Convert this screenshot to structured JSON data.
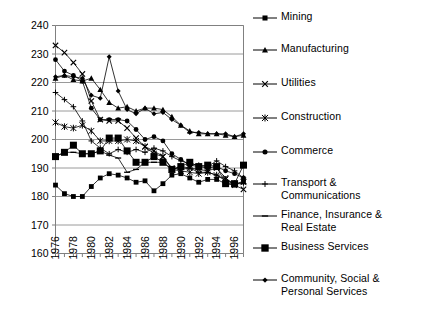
{
  "chart_data": {
    "type": "line",
    "title": "",
    "xlabel": "",
    "ylabel": "",
    "xlim": [
      1976,
      1997
    ],
    "ylim": [
      160,
      240
    ],
    "ytick_step": 10,
    "yticks": [
      160,
      170,
      180,
      190,
      200,
      210,
      220,
      230,
      240
    ],
    "xticks": [
      1976,
      1978,
      1980,
      1982,
      1984,
      1986,
      1988,
      1990,
      1992,
      1994,
      1996
    ],
    "xtick_labels": [
      "1976",
      "1978",
      "1980",
      "1982",
      "1984",
      "1986",
      "1988",
      "1990",
      "1992",
      "1994",
      "1996"
    ],
    "ytick_labels": [
      "160",
      "170",
      "180",
      "190",
      "200",
      "210",
      "220",
      "230",
      "240"
    ],
    "grid": "horizontal",
    "legend_position": "right",
    "x": [
      1976,
      1977,
      1978,
      1979,
      1980,
      1981,
      1982,
      1983,
      1984,
      1985,
      1986,
      1987,
      1988,
      1989,
      1990,
      1991,
      1992,
      1993,
      1994,
      1995,
      1996,
      1997
    ],
    "series": [
      {
        "name": "Mining",
        "marker": "square",
        "values": [
          184.0,
          181.0,
          180.0,
          180.0,
          183.5,
          186.5,
          188.0,
          187.5,
          186.5,
          185.0,
          185.5,
          182.0,
          184.5,
          187.5,
          188.0,
          186.5,
          185.0,
          186.0,
          186.0,
          184.5,
          184.0,
          185.5
        ]
      },
      {
        "name": "Manufacturing",
        "marker": "triangle",
        "values": [
          221.5,
          222.5,
          221.0,
          220.5,
          221.5,
          217.5,
          213.0,
          211.0,
          211.5,
          210.0,
          211.0,
          211.0,
          210.5,
          208.0,
          205.0,
          203.0,
          202.0,
          202.0,
          202.0,
          201.5,
          201.0,
          201.5
        ]
      },
      {
        "name": "Utilities",
        "marker": "x",
        "values": [
          233.0,
          230.5,
          227.0,
          223.0,
          213.5,
          207.0,
          206.5,
          206.5,
          204.0,
          200.5,
          197.5,
          196.0,
          194.0,
          190.0,
          189.5,
          190.0,
          189.5,
          189.0,
          190.0,
          186.5,
          184.0,
          182.5
        ]
      },
      {
        "name": "Construction",
        "marker": "asterisk",
        "values": [
          206.0,
          204.5,
          204.0,
          205.0,
          203.0,
          199.5,
          199.5,
          199.5,
          200.0,
          199.5,
          197.5,
          195.0,
          194.0,
          189.5,
          189.0,
          188.5,
          188.0,
          188.5,
          187.5,
          186.0,
          184.5,
          185.0
        ]
      },
      {
        "name": "Commerce",
        "marker": "circle",
        "values": [
          228.0,
          224.0,
          222.5,
          220.5,
          211.0,
          207.0,
          207.0,
          207.0,
          206.5,
          203.5,
          200.0,
          201.0,
          199.5,
          195.0,
          193.0,
          191.0,
          190.5,
          190.0,
          190.5,
          189.0,
          188.0,
          186.5
        ]
      },
      {
        "name": "Transport & Communications",
        "marker": "plus",
        "values": [
          216.5,
          214.0,
          211.5,
          206.5,
          199.5,
          197.0,
          195.0,
          196.5,
          195.5,
          196.5,
          195.5,
          197.0,
          196.0,
          194.0,
          192.5,
          191.5,
          191.0,
          190.5,
          192.5,
          190.5,
          189.0,
          186.5
        ]
      },
      {
        "name": "Finance, Insurance & Real Estate",
        "marker": "dash",
        "values": [
          194.0,
          195.5,
          195.5,
          195.0,
          195.0,
          196.0,
          194.5,
          193.5,
          188.5,
          189.5,
          192.0,
          192.0,
          192.0,
          189.5,
          190.5,
          190.0,
          188.5,
          188.5,
          187.5,
          185.5,
          184.5,
          184.5
        ]
      },
      {
        "name": "Business Services",
        "marker": "big-square",
        "values": [
          194.0,
          195.5,
          198.0,
          195.0,
          195.0,
          196.0,
          200.5,
          200.5,
          196.0,
          192.0,
          192.0,
          194.0,
          192.0,
          189.5,
          190.5,
          192.0,
          190.5,
          191.0,
          190.5,
          184.5,
          184.5,
          191.0
        ]
      },
      {
        "name": "Community, Social & Personal Services",
        "marker": "diamond",
        "values": [
          222.0,
          222.5,
          222.0,
          221.5,
          215.5,
          214.5,
          229.0,
          217.0,
          210.5,
          209.0,
          211.0,
          209.0,
          209.5,
          207.0,
          205.0,
          202.5,
          202.5,
          202.0,
          202.0,
          202.0,
          201.0,
          202.0
        ]
      }
    ]
  },
  "legend": {
    "items": [
      {
        "label": "Mining",
        "marker": "square"
      },
      {
        "label": "Manufacturing",
        "marker": "triangle"
      },
      {
        "label": "Utilities",
        "marker": "x"
      },
      {
        "label": "Construction",
        "marker": "asterisk"
      },
      {
        "label": "Commerce",
        "marker": "circle"
      },
      {
        "label": "Transport &\nCommunications",
        "marker": "plus"
      },
      {
        "label": "Finance, Insurance &\nReal Estate",
        "marker": "dash"
      },
      {
        "label": "Business Services",
        "marker": "big-square"
      },
      {
        "label": "Community, Social &\nPersonal Services",
        "marker": "diamond"
      }
    ]
  },
  "colors": {
    "series": "#000000",
    "grid": "#808080",
    "axis": "#808080",
    "background": "#ffffff"
  }
}
